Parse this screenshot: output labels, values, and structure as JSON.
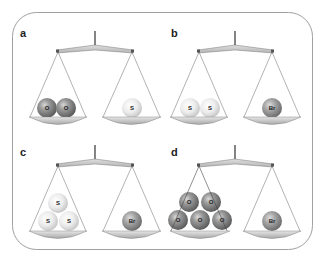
{
  "figure": {
    "colors": {
      "frame": "#9a9a9a",
      "beam": "#c9c9c9",
      "pan": "#c4c4c4",
      "string": "#555555",
      "oxygen": "#8a8a8a",
      "sulfur": "#e4e4e4",
      "bromine": "#9a9a9a"
    },
    "panels": [
      {
        "label": "a",
        "left": [
          "O",
          "O"
        ],
        "right": [
          "S"
        ]
      },
      {
        "label": "b",
        "left": [
          "S",
          "S"
        ],
        "right": [
          "Br"
        ]
      },
      {
        "label": "c",
        "left": [
          "S",
          "S",
          "S"
        ],
        "right": [
          "Br"
        ]
      },
      {
        "label": "d",
        "left": [
          "O",
          "O",
          "O",
          "O",
          "O"
        ],
        "right": [
          "Br"
        ]
      }
    ]
  }
}
